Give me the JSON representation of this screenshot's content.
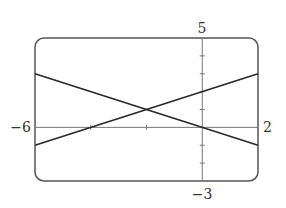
{
  "chart_data": {
    "type": "line",
    "title": "",
    "xlabel": "",
    "ylabel": "",
    "xlim": [
      -6,
      2
    ],
    "ylim": [
      -3,
      5
    ],
    "xscale_ticks": [
      -4,
      -2
    ],
    "yscale_ticks": [
      -2,
      -1,
      1,
      2,
      3,
      4
    ],
    "grid": false,
    "legend": null,
    "window_labels": {
      "xmin": "−6",
      "xmax": "2",
      "ymin": "−3",
      "ymax": "5"
    },
    "series": [
      {
        "name": "y = -x/2",
        "points": [
          [
            -6,
            3
          ],
          [
            2,
            -1
          ]
        ]
      },
      {
        "name": "y = (x+4)/2",
        "points": [
          [
            -6,
            -1
          ],
          [
            2,
            3
          ]
        ]
      }
    ],
    "intersection": [
      -2,
      1
    ]
  },
  "style": {
    "line_color": "#2a2a2a",
    "frame_color": "#555555",
    "axis_color": "#777777"
  }
}
